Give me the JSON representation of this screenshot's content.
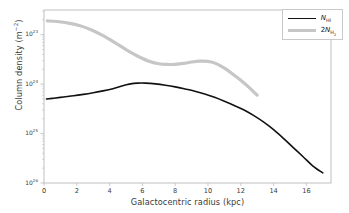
{
  "figure": {
    "background": "#ffffff",
    "axes_color": "#bfbfbf",
    "text_color": "#3a3a3a"
  },
  "axes": {
    "ylabel": "Column density (m",
    "ylabel_exp": "−2",
    "ylabel_tail": ")",
    "xlabel": "Galactocentric radius (kpc)",
    "xticks": [
      "0",
      "2",
      "4",
      "6",
      "8",
      "10",
      "12",
      "14",
      "16"
    ],
    "ytick_mantissa": "10",
    "yticks_exp": [
      "26",
      "25",
      "24",
      "23"
    ]
  },
  "legend": {
    "position": "upper-right",
    "items": [
      {
        "label_main": "N",
        "label_sub": "HI",
        "color": "#111111",
        "width": 1.6
      },
      {
        "label_main": "2N",
        "label_sub": "H₂",
        "color": "#c6c6c6",
        "width": 3.2
      }
    ]
  },
  "chart_data": {
    "type": "line",
    "title": "",
    "xlabel": "Galactocentric radius (kpc)",
    "ylabel": "Column density (m^-2)",
    "xlim": [
      0,
      17.5
    ],
    "ylim": [
      1e+23,
      3.16e+26
    ],
    "yscale": "log",
    "xscale": "linear",
    "grid": false,
    "legend_position": "upper right",
    "xticks": [
      0,
      2,
      4,
      6,
      8,
      10,
      12,
      14,
      16
    ],
    "yticks": [
      1e+23,
      1e+24,
      1e+25,
      1e+26
    ],
    "series": [
      {
        "name": "N_HI",
        "color": "#111111",
        "linewidth": 1.6,
        "x": [
          0.15,
          0.6,
          1.2,
          1.8,
          2.4,
          3.0,
          3.6,
          4.2,
          4.8,
          5.2,
          5.7,
          6.2,
          6.8,
          7.4,
          8.0,
          8.6,
          9.2,
          9.8,
          10.4,
          11.0,
          11.6,
          12.2,
          12.8,
          13.4,
          14.0,
          14.6,
          15.2,
          15.8,
          16.4,
          17.0
        ],
        "y": [
          5e+24,
          5.2e+24,
          5.5e+24,
          5.8e+24,
          6.2e+24,
          6.7e+24,
          7.3e+24,
          8.1e+24,
          9.3e+24,
          1e+25,
          1.05e+25,
          1.05e+25,
          1.01e+25,
          9.5e+24,
          8.8e+24,
          8e+24,
          7.2e+24,
          6.3e+24,
          5.4e+24,
          4.5e+24,
          3.7e+24,
          3e+24,
          2.3e+24,
          1.7e+24,
          1.2e+24,
          8e+23,
          5.2e+23,
          3.4e+23,
          2.2e+23,
          1.6e+23
        ]
      },
      {
        "name": "2N_H2",
        "color": "#c6c6c6",
        "linewidth": 3.2,
        "x": [
          0.2,
          0.8,
          1.5,
          2.2,
          2.9,
          3.6,
          4.3,
          5.0,
          5.7,
          6.4,
          7.0,
          7.5,
          8.0,
          8.5,
          9.0,
          9.5,
          10.0,
          10.5,
          11.0,
          11.5,
          12.0,
          12.5,
          13.0
        ],
        "y": [
          1.9e+26,
          1.85e+26,
          1.72e+26,
          1.52e+26,
          1.25e+26,
          9.6e+25,
          7e+25,
          5e+25,
          3.7e+25,
          2.9e+25,
          2.58e+25,
          2.5e+25,
          2.52e+25,
          2.62e+25,
          2.8e+25,
          2.92e+25,
          2.88e+25,
          2.6e+25,
          2.1e+25,
          1.6e+25,
          1.2e+25,
          8.6e+24,
          6e+24
        ]
      }
    ]
  }
}
